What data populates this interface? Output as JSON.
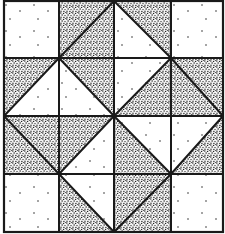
{
  "figure": {
    "colors": {
      "background": "#ffffff",
      "line": "#1a1a1a",
      "stipple_dark": "#222222",
      "white_fill": "#ffffff"
    },
    "grid": {
      "x": [
        4,
        59,
        114,
        171,
        223
      ],
      "y": [
        1,
        58,
        116,
        174,
        232
      ]
    },
    "pieces": {
      "corner_squares": [
        "top-left",
        "top-right",
        "bottom-left",
        "bottom-right"
      ],
      "white_triangles": [
        "top-pointing-right",
        "left-pointing-up",
        "right-pointing-down",
        "bottom-pointing-left"
      ],
      "stippled_regions": "all remaining triangles"
    }
  }
}
